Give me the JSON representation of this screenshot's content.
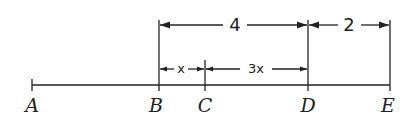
{
  "diagram": {
    "type": "segment-length-diagram",
    "points": [
      {
        "label": "A",
        "x": 32
      },
      {
        "label": "B",
        "x": 159
      },
      {
        "label": "C",
        "x": 205
      },
      {
        "label": "D",
        "x": 308
      },
      {
        "label": "E",
        "x": 390
      }
    ],
    "dimensions": [
      {
        "from": "B",
        "to": "D",
        "label": "4",
        "row": "top"
      },
      {
        "from": "D",
        "to": "E",
        "label": "2",
        "row": "top"
      },
      {
        "from": "B",
        "to": "C",
        "label": "x",
        "row": "middle"
      },
      {
        "from": "C",
        "to": "D",
        "label": "3x",
        "row": "middle"
      }
    ]
  }
}
